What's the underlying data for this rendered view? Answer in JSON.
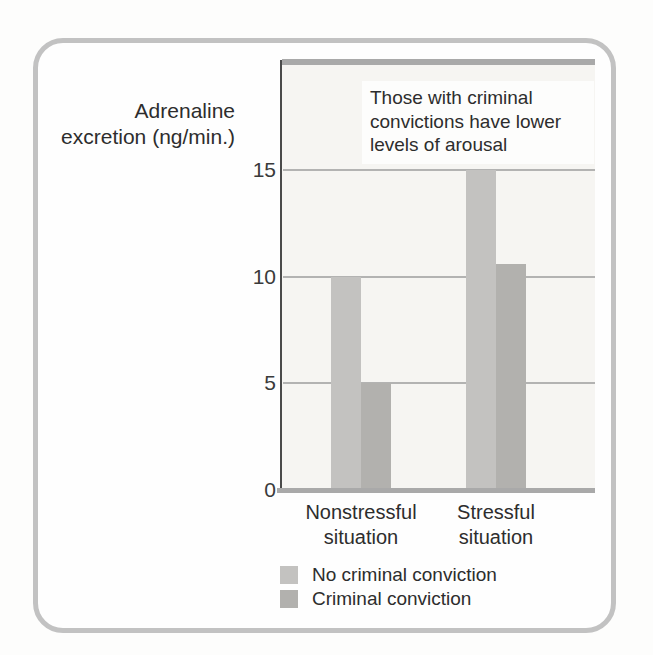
{
  "figure": {
    "ylabel_display": "Adrenaline\nexcretion (ng/min.)",
    "annotation": "Those with criminal convictions have lower levels of arousal"
  },
  "chart_data": {
    "type": "bar",
    "title": "",
    "xlabel": "",
    "ylabel": "Adrenaline excretion (ng/min.)",
    "categories": [
      "Nonstressful situation",
      "Stressful situation"
    ],
    "series": [
      {
        "name": "No criminal conviction",
        "values": [
          10,
          15
        ],
        "color": "#c3c2c0"
      },
      {
        "name": "Criminal conviction",
        "values": [
          5,
          10.6
        ],
        "color": "#b2b1ae"
      }
    ],
    "yticks": [
      0,
      5,
      10,
      15
    ],
    "gridline_values": [
      5,
      10,
      15
    ],
    "ylim": [
      0,
      20
    ],
    "grid": true,
    "legend_position": "bottom",
    "annotation": "Those with criminal convictions have lower levels of arousal"
  },
  "colors": {
    "frame_border": "#c2c2c2",
    "plot_background": "#f6f5f2",
    "axis_line": "#4a4a4a",
    "plot_border": "#a9a9a9",
    "gridline": "#9c9c9c",
    "text": "#2d2d2d"
  }
}
